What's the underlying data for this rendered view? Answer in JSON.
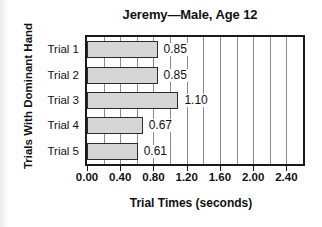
{
  "chart_data": {
    "type": "bar",
    "orientation": "horizontal",
    "title": "Jeremy—Male, Age 12",
    "xlabel": "Trial Times (seconds)",
    "ylabel": "Trials With Dominant Hand",
    "categories": [
      "Trial 1",
      "Trial 2",
      "Trial 3",
      "Trial 4",
      "Trial 5"
    ],
    "values": [
      0.85,
      0.85,
      1.1,
      0.67,
      0.61
    ],
    "value_labels": [
      "0.85",
      "0.85",
      "1.10",
      "0.67",
      "0.61"
    ],
    "xlim": [
      0.0,
      2.6
    ],
    "xtick_values": [
      0.0,
      0.4,
      0.8,
      1.2,
      1.6,
      2.0,
      2.4
    ],
    "xtick_labels": [
      "0.00",
      "0.40",
      "0.80",
      "1.20",
      "1.60",
      "2.00",
      "2.40"
    ],
    "gridline_values": [
      0.2,
      0.4,
      0.6,
      0.8,
      1.0,
      1.2,
      1.4,
      1.6,
      1.8,
      2.0,
      2.2,
      2.4
    ],
    "grid": true,
    "legend": null,
    "colors": {
      "bar_fill": "#d6d6d6",
      "bar_border": "#2b2b2b",
      "gridline": "#8a8a8a",
      "frame": "#1a1a1a",
      "text": "#111111",
      "background": "#ffffff"
    }
  }
}
